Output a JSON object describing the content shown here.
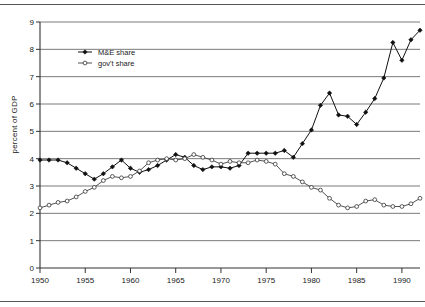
{
  "chart_data": {
    "type": "line",
    "title": "",
    "xlabel": "",
    "ylabel": "percent of GDP",
    "xlim": [
      1950,
      1992
    ],
    "ylim": [
      0,
      9
    ],
    "grid": true,
    "grid_axis": "y",
    "legend_position": "upper-left-inside",
    "xticks": [
      1950,
      1955,
      1960,
      1965,
      1970,
      1975,
      1980,
      1985,
      1990
    ],
    "xticklabels": [
      "1950",
      "1955",
      "1960",
      "1965",
      "1970",
      "1975",
      "1980",
      "1985",
      "1990"
    ],
    "yticks": [
      0,
      1,
      2,
      3,
      4,
      5,
      6,
      7,
      8,
      9
    ],
    "yticklabels": [
      "0",
      "1",
      "2",
      "3",
      "4",
      "5",
      "6",
      "7",
      "8",
      "9"
    ],
    "x": [
      1950,
      1951,
      1952,
      1953,
      1954,
      1955,
      1956,
      1957,
      1958,
      1959,
      1960,
      1961,
      1962,
      1963,
      1964,
      1965,
      1966,
      1967,
      1968,
      1969,
      1970,
      1971,
      1972,
      1973,
      1974,
      1975,
      1976,
      1977,
      1978,
      1979,
      1980,
      1981,
      1982,
      1983,
      1984,
      1985,
      1986,
      1987,
      1988,
      1989,
      1990,
      1991,
      1992
    ],
    "series": [
      {
        "name": "M&E share",
        "marker": "filled-diamond",
        "color": "#111111",
        "values": [
          3.95,
          3.95,
          3.95,
          3.85,
          3.65,
          3.45,
          3.25,
          3.45,
          3.7,
          3.95,
          3.65,
          3.5,
          3.6,
          3.75,
          3.95,
          4.15,
          4.05,
          3.75,
          3.6,
          3.7,
          3.7,
          3.65,
          3.75,
          4.2,
          4.2,
          4.2,
          4.2,
          4.3,
          4.05,
          4.55,
          5.05,
          5.95,
          6.4,
          5.6,
          5.55,
          5.25,
          5.7,
          6.2,
          6.95,
          8.25,
          7.6,
          8.35,
          8.7
        ]
      },
      {
        "name": "gov't share",
        "marker": "open-circle",
        "color": "#333333",
        "values": [
          2.2,
          2.3,
          2.4,
          2.45,
          2.6,
          2.8,
          2.95,
          3.2,
          3.35,
          3.3,
          3.35,
          3.55,
          3.85,
          3.95,
          4.0,
          3.95,
          4.0,
          4.15,
          4.05,
          3.95,
          3.8,
          3.9,
          3.85,
          3.85,
          3.95,
          3.9,
          3.8,
          3.45,
          3.35,
          3.15,
          3.1,
          3.05,
          2.85,
          2.75,
          2.55,
          2.35,
          2.25,
          2.3,
          2.45,
          2.6,
          2.45,
          2.4,
          2.35
        ]
      }
    ],
    "series_gov_tail": {
      "note": "gov't share later years",
      "x": [
        1980,
        1981,
        1982,
        1983,
        1984,
        1985,
        1986,
        1987,
        1988,
        1989,
        1990,
        1991,
        1992
      ],
      "values": [
        2.95,
        2.85,
        2.55,
        2.3,
        2.2,
        2.25,
        2.45,
        2.5,
        2.3,
        2.25,
        2.25,
        2.35,
        2.55
      ]
    }
  },
  "legend": {
    "entries": [
      {
        "label": "M&E share"
      },
      {
        "label": "gov't share"
      }
    ]
  }
}
